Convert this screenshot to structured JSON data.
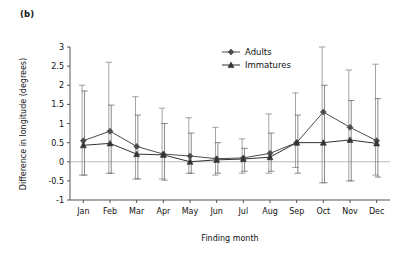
{
  "figure": {
    "panel_label": "(b)"
  },
  "chart_data": {
    "type": "line",
    "title": "",
    "xlabel": "Finding month",
    "ylabel": "Difference in longitude (degrees)",
    "categories": [
      "Jan",
      "Feb",
      "Mar",
      "Apr",
      "May",
      "Jun",
      "Jul",
      "Aug",
      "Sep",
      "Oct",
      "Nov",
      "Dec"
    ],
    "ylim": [
      -1,
      3
    ],
    "yticks": [
      -1,
      -0.5,
      0,
      0.5,
      1,
      1.5,
      2,
      2.5,
      3
    ],
    "ytick_labels": [
      "-1",
      "-0.5",
      "0",
      "0.5",
      "1",
      "1.5",
      "2",
      "2.5",
      "3"
    ],
    "grid": false,
    "zero_line": true,
    "legend_position": "top-center",
    "error_bars": "vertical",
    "series": [
      {
        "name": "Adults",
        "marker": "diamond",
        "color": "#4d4d4d",
        "values": [
          0.55,
          0.8,
          0.4,
          0.2,
          0.15,
          0.08,
          0.1,
          0.22,
          0.5,
          1.3,
          0.9,
          0.55
        ],
        "err_upper": [
          2.0,
          2.6,
          1.7,
          1.4,
          1.15,
          0.9,
          0.6,
          1.25,
          1.8,
          3.0,
          2.4,
          2.55
        ],
        "err_lower": [
          -0.35,
          -0.3,
          -0.45,
          -0.45,
          -0.3,
          -0.35,
          -0.3,
          -0.3,
          -0.15,
          -0.55,
          -0.5,
          -0.35
        ]
      },
      {
        "name": "Immatures",
        "marker": "triangle",
        "color": "#333333",
        "values": [
          0.43,
          0.48,
          0.2,
          0.18,
          0.0,
          0.05,
          0.07,
          0.12,
          0.5,
          0.5,
          0.57,
          0.48
        ],
        "err_upper": [
          1.85,
          1.48,
          1.22,
          1.0,
          0.75,
          0.5,
          0.35,
          0.75,
          1.22,
          2.0,
          1.6,
          1.65
        ],
        "err_lower": [
          -0.35,
          -0.3,
          -0.45,
          -0.48,
          -0.3,
          -0.3,
          -0.25,
          -0.25,
          -0.3,
          -0.55,
          -0.5,
          -0.4
        ]
      }
    ]
  },
  "legend": {
    "items": [
      {
        "label": "Adults"
      },
      {
        "label": "Immatures"
      }
    ]
  }
}
